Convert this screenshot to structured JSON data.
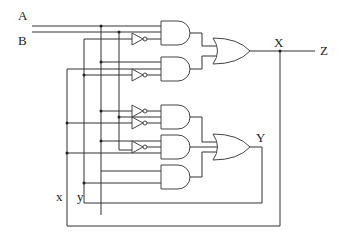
{
  "diagram": {
    "type": "logic-circuit",
    "labels": {
      "input_a": "A",
      "input_b": "B",
      "output_x": "X",
      "output_z": "Z",
      "output_y": "Y",
      "feedback_x": "x",
      "feedback_y": "y"
    },
    "gates": [
      {
        "id": "and1",
        "type": "AND",
        "inputs": [
          "A",
          "B'"
        ],
        "output": "to OR1"
      },
      {
        "id": "and2",
        "type": "AND",
        "inputs": [
          "A",
          "x",
          "B'"
        ],
        "output": "to OR1"
      },
      {
        "id": "or1",
        "type": "OR",
        "inputs": [
          "and1",
          "and2"
        ],
        "output": "X"
      },
      {
        "id": "and3",
        "type": "AND",
        "inputs": [
          "A'",
          "B",
          "x'"
        ],
        "output": "to OR2"
      },
      {
        "id": "and4",
        "type": "AND",
        "inputs": [
          "A",
          "x",
          "B'"
        ],
        "output": "to OR2"
      },
      {
        "id": "and5",
        "type": "AND",
        "inputs": [
          "A",
          "y"
        ],
        "output": "to OR2"
      },
      {
        "id": "or2",
        "type": "OR",
        "inputs": [
          "and3",
          "and4",
          "and5"
        ],
        "output": "Y"
      }
    ],
    "inverter_count": 5
  }
}
